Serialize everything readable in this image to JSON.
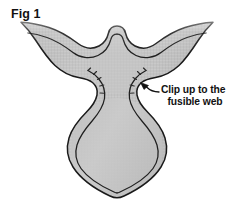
{
  "figure": {
    "title": "Fig 1",
    "background_color": "#ffffff"
  },
  "annotations": [
    {
      "id": "clip-callout",
      "lines": [
        "Clip up to the",
        "fusible web"
      ],
      "line_1": "Clip up to the",
      "line_2": "fusible web",
      "leader": "line-with-arrowhead",
      "points_to": "right-waist-notch"
    }
  ],
  "colors": {
    "fabric_fill": "#c2c2c2",
    "fabric_fill_light": "#cfcfcf",
    "seam_band": "#b0b0b0",
    "outline": "#1a1a1a",
    "clip_line": "#2b2b2b",
    "text": "#111111",
    "background": "#ffffff",
    "feather_edge": "#8f8f8f"
  },
  "shape": {
    "description": "Symmetric pattern piece: two flared upper wings separated by a central U-shaped notch, narrowing through a clipped waist into a teardrop-shaped lower body.",
    "parts": [
      "left-wing",
      "right-wing",
      "center-top-notch",
      "left-waist-clip-notch",
      "right-waist-clip-notch",
      "lower-bulb"
    ],
    "clip_marks_per_notch": 5,
    "has_inner_seam_line": true,
    "top_edge_style": "feathered-gradient"
  }
}
